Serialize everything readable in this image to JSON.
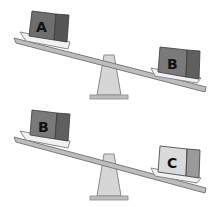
{
  "diagram": {
    "type": "balance-scales",
    "scales": [
      {
        "id": "scale-top",
        "tilt": "left-side-up",
        "left_block": {
          "label": "A",
          "color": "#6b6b6b"
        },
        "right_block": {
          "label": "B",
          "color": "#7a7a7a"
        }
      },
      {
        "id": "scale-bottom",
        "tilt": "left-side-up",
        "left_block": {
          "label": "B",
          "color": "#7a7a7a"
        },
        "right_block": {
          "label": "C",
          "color": "#d9d9d9"
        }
      }
    ]
  }
}
